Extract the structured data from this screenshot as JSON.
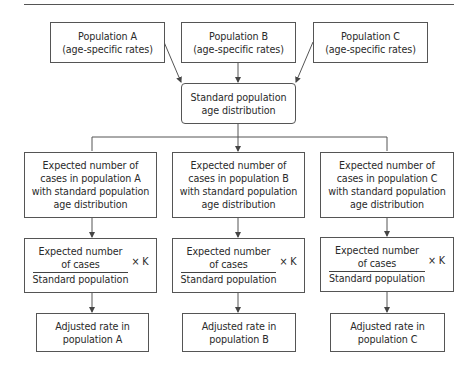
{
  "diagram": {
    "title_rule": true,
    "row1": [
      {
        "id": "pop-a",
        "label": "Population A\n(age-specific rates)"
      },
      {
        "id": "pop-b",
        "label": "Population B\n(age-specific rates)"
      },
      {
        "id": "pop-c",
        "label": "Population C\n(age-specific rates)"
      }
    ],
    "standard": {
      "label": "Standard population\nage distribution"
    },
    "row2": [
      {
        "label": "Expected number of\ncases in population A\nwith standard population\nage distribution"
      },
      {
        "label": "Expected number of\ncases in population B\nwith standard population\nage distribution"
      },
      {
        "label": "Expected number of\ncases in population C\nwith standard population\nage distribution"
      }
    ],
    "row3": [
      {
        "numerator": "Expected number\nof cases",
        "denominator": "Standard population",
        "multiplier": "× K"
      },
      {
        "numerator": "Expected number\nof cases",
        "denominator": "Standard population",
        "multiplier": "× K"
      },
      {
        "numerator": "Expected number\nof cases",
        "denominator": "Standard population",
        "multiplier": "× K"
      }
    ],
    "row4": [
      {
        "label": "Adjusted rate in\npopulation A"
      },
      {
        "label": "Adjusted rate in\npopulation B"
      },
      {
        "label": "Adjusted rate in\npopulation C"
      }
    ],
    "colors": {
      "line": "#555555",
      "text": "#2a2a2a",
      "background": "#ffffff"
    }
  }
}
